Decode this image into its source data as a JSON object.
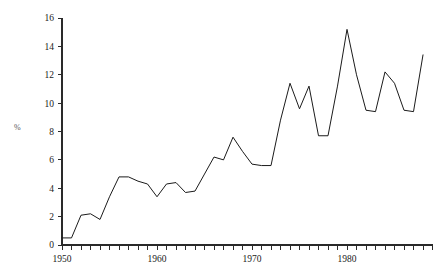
{
  "chart_data": {
    "type": "line",
    "title": "",
    "xlabel": "",
    "ylabel": "%",
    "xlim": [
      1950,
      1988
    ],
    "ylim": [
      0,
      16
    ],
    "grid": false,
    "legend": "none",
    "y_ticks": [
      0,
      2,
      4,
      6,
      8,
      10,
      12,
      14,
      16
    ],
    "y_tick_labels": [
      "0",
      "2",
      "4",
      "6",
      "8",
      "10",
      "12",
      "14",
      "16"
    ],
    "x_ticks": [
      1950,
      1951,
      1952,
      1953,
      1954,
      1955,
      1956,
      1957,
      1958,
      1959,
      1960,
      1961,
      1962,
      1963,
      1964,
      1965,
      1966,
      1967,
      1968,
      1969,
      1970,
      1971,
      1972,
      1973,
      1974,
      1975,
      1976,
      1977,
      1978,
      1979,
      1980,
      1981,
      1982,
      1983,
      1984,
      1985,
      1986,
      1987,
      1988
    ],
    "x_tick_labels": [
      "1950",
      "1960",
      "1970",
      "1980"
    ],
    "x_labeled_ticks": [
      1950,
      1960,
      1970,
      1980
    ],
    "x": [
      1950,
      1951,
      1952,
      1953,
      1954,
      1955,
      1956,
      1957,
      1958,
      1959,
      1960,
      1961,
      1962,
      1963,
      1964,
      1965,
      1966,
      1967,
      1968,
      1969,
      1970,
      1971,
      1972,
      1973,
      1974,
      1975,
      1976,
      1977,
      1978,
      1979,
      1980,
      1981,
      1982,
      1983,
      1984,
      1985,
      1986,
      1987,
      1988
    ],
    "values": [
      0.5,
      0.5,
      2.1,
      2.2,
      1.8,
      3.4,
      4.8,
      4.8,
      4.5,
      4.3,
      3.4,
      4.3,
      4.4,
      3.7,
      3.8,
      5.0,
      6.2,
      6.0,
      7.6,
      6.6,
      5.7,
      5.6,
      5.6,
      8.8,
      11.4,
      9.6,
      11.2,
      7.7,
      7.7,
      11.2,
      15.2,
      12.0,
      9.5,
      9.4,
      12.2,
      11.4,
      9.5,
      9.4,
      13.4
    ],
    "series_name": "percent",
    "line_color": "#1b1b1b"
  },
  "axis": {
    "y_label": "%"
  }
}
